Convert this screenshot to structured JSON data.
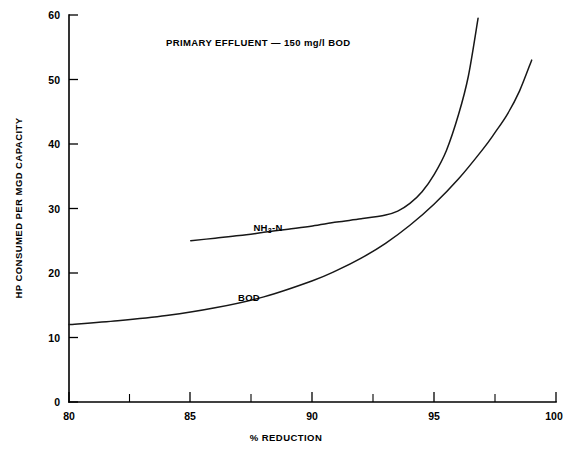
{
  "chart_data": {
    "type": "line",
    "title": "PRIMARY EFFLUENT — 150 mg/l BOD",
    "xlabel": "% REDUCTION",
    "ylabel": "HP CONSUMED PER MGD CAPACITY",
    "xlim": [
      80,
      100
    ],
    "ylim": [
      0,
      60
    ],
    "grid": false,
    "legend_position": "inline-labels",
    "xticks": [
      80,
      85,
      90,
      95,
      100
    ],
    "xtick_labels": [
      "80",
      "85",
      "90",
      "95",
      "100"
    ],
    "xticks_minor": [
      82.5,
      87.5,
      92.5,
      97.5
    ],
    "yticks": [
      0,
      10,
      20,
      30,
      40,
      50,
      60
    ],
    "ytick_labels": [
      "0",
      "10",
      "20",
      "30",
      "40",
      "50",
      "60"
    ],
    "series": [
      {
        "name": "BOD",
        "label": "BOD",
        "label_text": "BOD",
        "color": "#171717",
        "x": [
          80,
          82,
          84,
          86,
          88,
          90,
          91,
          92,
          93,
          94,
          95,
          96,
          97,
          97.5,
          98,
          98.5,
          99
        ],
        "values": [
          12.0,
          12.6,
          13.4,
          14.6,
          16.3,
          18.8,
          20.4,
          22.3,
          24.6,
          27.4,
          30.7,
          34.6,
          39.2,
          41.8,
          44.6,
          48.2,
          53.0
        ]
      },
      {
        "name": "NH3-N",
        "label": "NH₃-N",
        "label_prefix": "NH",
        "label_subscript": "3",
        "label_suffix": "-N",
        "color": "#171717",
        "x": [
          85,
          86,
          87,
          88,
          89,
          90,
          91,
          92,
          93,
          93.5,
          94,
          94.5,
          95,
          95.5,
          96,
          96.4,
          96.8
        ],
        "values": [
          25.0,
          25.4,
          25.8,
          26.3,
          26.8,
          27.3,
          27.9,
          28.4,
          29.0,
          29.6,
          30.8,
          32.6,
          35.3,
          39.0,
          44.6,
          50.5,
          59.5
        ]
      }
    ],
    "annotations": [
      {
        "text": "NH₃-N",
        "x": 92.5,
        "y": 31.5
      },
      {
        "text": "BOD",
        "x": 91.3,
        "y": 21.6
      }
    ]
  }
}
